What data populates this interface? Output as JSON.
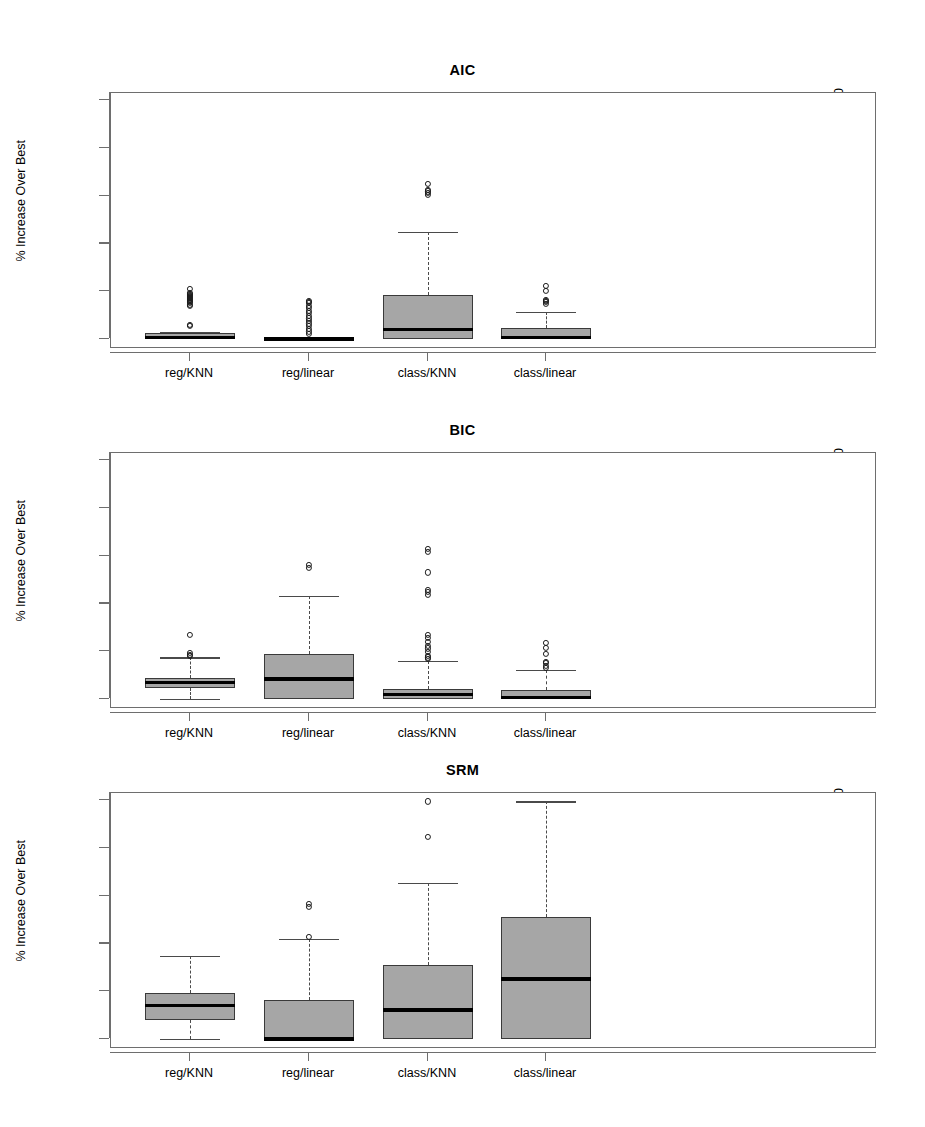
{
  "figure": {
    "y_axis_label": "% Increase Over Best",
    "y_ticks": [
      0,
      20,
      40,
      60,
      80,
      100
    ],
    "categories": [
      "reg/KNN",
      "reg/linear",
      "class/KNN",
      "class/linear"
    ]
  },
  "chart_data": {
    "type": "box",
    "title": "",
    "xlabel": "",
    "ylabel": "% Increase Over Best",
    "ylim": [
      0,
      103
    ],
    "grid": false,
    "legend": "none",
    "categories": [
      "reg/KNN",
      "reg/linear",
      "class/KNN",
      "class/linear"
    ],
    "panels": [
      {
        "title": "AIC",
        "boxes": [
          {
            "category": "reg/KNN",
            "whisker_low": 0.0,
            "q1": 0.0,
            "median": 0.7,
            "q3": 2.6,
            "whisker_high": 2.8,
            "outliers": [
              5.5,
              6.0,
              13.8,
              14.2,
              15.1,
              15.6,
              16.0,
              16.3,
              16.8,
              17.2,
              17.6,
              18.0,
              18.4,
              18.9,
              19.3,
              21.0
            ]
          },
          {
            "category": "reg/linear",
            "whisker_low": 0.0,
            "q1": 0.0,
            "median": 0.0,
            "q3": 0.2,
            "whisker_high": 0.3,
            "outliers": [
              2.0,
              3.2,
              4.3,
              5.4,
              6.5,
              7.6,
              8.6,
              9.7,
              10.8,
              11.9,
              13.0,
              14.0,
              15.0,
              15.6,
              16.0
            ]
          },
          {
            "category": "class/KNN",
            "whisker_low": 0.0,
            "q1": 0.0,
            "median": 4.0,
            "q3": 18.5,
            "whisker_high": 44.8,
            "outliers": [
              60.5,
              61.2,
              61.8,
              62.4,
              65.0
            ]
          },
          {
            "category": "class/linear",
            "whisker_low": 0.0,
            "q1": 0.0,
            "median": 0.6,
            "q3": 4.6,
            "whisker_high": 11.5,
            "outliers": [
              14.8,
              15.4,
              16.0,
              16.5,
              20.0,
              22.4
            ]
          }
        ]
      },
      {
        "title": "BIC",
        "boxes": [
          {
            "category": "reg/KNN",
            "whisker_low": 0.0,
            "q1": 4.5,
            "median": 6.8,
            "q3": 8.6,
            "whisker_high": 17.4,
            "outliers": [
              18.0,
              18.6,
              19.2,
              26.8
            ]
          },
          {
            "category": "reg/linear",
            "whisker_low": 0.0,
            "q1": 0.0,
            "median": 8.4,
            "q3": 18.9,
            "whisker_high": 43.0,
            "outliers": [
              55.0,
              56.2
            ]
          },
          {
            "category": "class/KNN",
            "whisker_low": 0.0,
            "q1": 0.0,
            "median": 1.8,
            "q3": 4.2,
            "whisker_high": 16.0,
            "outliers": [
              16.8,
              17.4,
              18.0,
              19.6,
              21.2,
              22.4,
              24.0,
              25.6,
              27.0,
              43.5,
              44.8,
              45.6,
              53.0,
              61.5,
              63.0
            ]
          },
          {
            "category": "class/linear",
            "whisker_low": 0.0,
            "q1": 0.0,
            "median": 0.6,
            "q3": 3.6,
            "whisker_high": 12.2,
            "outliers": [
              13.0,
              14.0,
              15.0,
              15.6,
              19.0,
              21.5,
              23.5
            ]
          }
        ]
      },
      {
        "title": "SRM",
        "boxes": [
          {
            "category": "reg/KNN",
            "whisker_low": 0.0,
            "q1": 8.0,
            "median": 14.0,
            "q3": 19.4,
            "whisker_high": 34.8,
            "outliers": []
          },
          {
            "category": "reg/linear",
            "whisker_low": 0.0,
            "q1": 0.0,
            "median": 0.0,
            "q3": 16.4,
            "whisker_high": 41.8,
            "outliers": [
              42.6,
              55.2,
              56.4
            ]
          },
          {
            "category": "class/KNN",
            "whisker_low": 0.0,
            "q1": 0.0,
            "median": 12.2,
            "q3": 31.0,
            "whisker_high": 65.5,
            "outliers": [
              84.5,
              99.5
            ]
          },
          {
            "category": "class/linear",
            "whisker_low": 0.0,
            "q1": 0.0,
            "median": 25.2,
            "q3": 51.2,
            "whisker_high": 99.5,
            "outliers": []
          }
        ]
      }
    ]
  }
}
